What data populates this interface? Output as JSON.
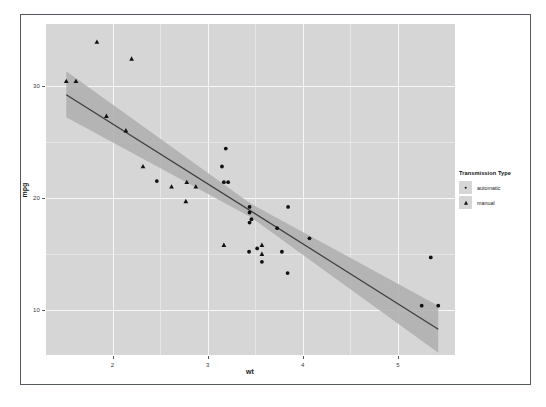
{
  "chart_data": {
    "type": "scatter",
    "title": "",
    "xlabel": "wt",
    "ylabel": "mpg",
    "xlim": [
      1.3,
      5.6
    ],
    "ylim": [
      6.0,
      35.5
    ],
    "xticks": [
      2,
      3,
      4,
      5
    ],
    "xtick_labels": [
      "2",
      "3",
      "4",
      "5"
    ],
    "yticks": [
      10,
      20,
      30
    ],
    "ytick_labels": [
      "10",
      "20",
      "30"
    ],
    "grid": true,
    "legend": {
      "title": "Transmission Type",
      "position": "right",
      "entries": [
        {
          "label": "automatic",
          "marker": "circle"
        },
        {
          "label": "manual",
          "marker": "triangle"
        }
      ]
    },
    "series": [
      {
        "name": "automatic",
        "marker": "circle",
        "color": "#111111",
        "points": [
          {
            "x": 3.215,
            "y": 21.4
          },
          {
            "x": 3.44,
            "y": 18.7
          },
          {
            "x": 3.46,
            "y": 18.1
          },
          {
            "x": 3.57,
            "y": 14.3
          },
          {
            "x": 3.19,
            "y": 24.4
          },
          {
            "x": 3.15,
            "y": 22.8
          },
          {
            "x": 4.07,
            "y": 16.4
          },
          {
            "x": 3.73,
            "y": 17.3
          },
          {
            "x": 3.78,
            "y": 15.2
          },
          {
            "x": 5.25,
            "y": 10.4
          },
          {
            "x": 5.424,
            "y": 10.4
          },
          {
            "x": 5.345,
            "y": 14.7
          },
          {
            "x": 2.465,
            "y": 21.5
          },
          {
            "x": 3.52,
            "y": 15.5
          },
          {
            "x": 3.435,
            "y": 15.2
          },
          {
            "x": 3.84,
            "y": 13.3
          },
          {
            "x": 3.845,
            "y": 19.2
          },
          {
            "x": 3.17,
            "y": 21.4
          },
          {
            "x": 3.44,
            "y": 17.8
          },
          {
            "x": 3.44,
            "y": 19.2
          }
        ]
      },
      {
        "name": "manual",
        "marker": "triangle",
        "color": "#111111",
        "points": [
          {
            "x": 2.62,
            "y": 21.0
          },
          {
            "x": 2.875,
            "y": 21.0
          },
          {
            "x": 2.32,
            "y": 22.8
          },
          {
            "x": 1.835,
            "y": 33.9
          },
          {
            "x": 2.2,
            "y": 32.4
          },
          {
            "x": 1.615,
            "y": 30.4
          },
          {
            "x": 1.513,
            "y": 30.4
          },
          {
            "x": 1.935,
            "y": 27.3
          },
          {
            "x": 2.14,
            "y": 26.0
          },
          {
            "x": 2.77,
            "y": 19.7
          },
          {
            "x": 3.17,
            "y": 15.8
          },
          {
            "x": 2.78,
            "y": 21.4
          },
          {
            "x": 3.57,
            "y": 15.0
          },
          {
            "x": 3.57,
            "y": 15.8
          }
        ]
      }
    ],
    "smooth": {
      "method": "lm",
      "line_color": "#3c3c3c",
      "ribbon_color": "#aeaeae",
      "fit": [
        {
          "x": 1.513,
          "y": 29.2
        },
        {
          "x": 5.424,
          "y": 8.3
        }
      ],
      "ribbon_upper": [
        {
          "x": 1.513,
          "y": 31.3
        },
        {
          "x": 3.45,
          "y": 19.5
        },
        {
          "x": 5.424,
          "y": 10.4
        }
      ],
      "ribbon_lower": [
        {
          "x": 1.513,
          "y": 27.2
        },
        {
          "x": 3.45,
          "y": 18.3
        },
        {
          "x": 5.424,
          "y": 6.2
        }
      ]
    }
  },
  "panel": {
    "background_color": "#d6d6d6",
    "gridline_color": "#f7f7f7",
    "border_color": "#555a60"
  }
}
